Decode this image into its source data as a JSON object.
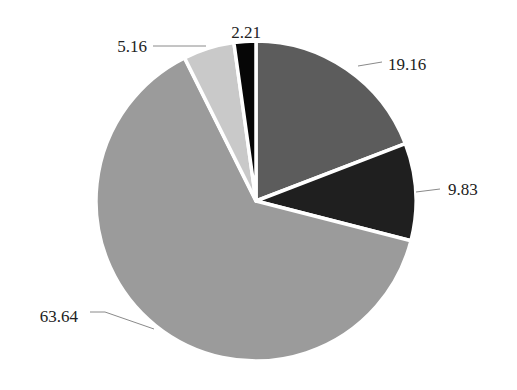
{
  "chart_data": {
    "type": "pie",
    "title": "",
    "start_angle_deg": 0,
    "direction": "clockwise",
    "values": [
      19.16,
      9.83,
      63.64,
      5.16,
      2.21
    ],
    "labels": [
      "19.16",
      "9.83",
      "63.64",
      "5.16",
      "2.21"
    ],
    "colors": [
      "#5c5c5c",
      "#1f1f1f",
      "#9b9b9b",
      "#c9c9c9",
      "#060606"
    ],
    "separator_color": "#ffffff",
    "legend": null
  },
  "geometry": {
    "cx": 256,
    "cy": 201,
    "r": 160
  },
  "label_positions": [
    {
      "text": "19.16",
      "x": 388,
      "y": 70,
      "anchor": "start",
      "leader": [
        [
          358,
          66
        ],
        [
          382,
          62
        ]
      ]
    },
    {
      "text": "9.83",
      "x": 448,
      "y": 195,
      "anchor": "start",
      "leader": [
        [
          416,
          192
        ],
        [
          440,
          189
        ]
      ]
    },
    {
      "text": "63.64",
      "x": 78,
      "y": 322,
      "anchor": "end",
      "leader": [
        [
          90,
          312
        ],
        [
          105,
          312
        ],
        [
          154,
          329
        ]
      ]
    },
    {
      "text": "5.16",
      "x": 147,
      "y": 52,
      "anchor": "end",
      "leader": [
        [
          153,
          46
        ],
        [
          206,
          46
        ]
      ]
    },
    {
      "text": "2.21",
      "x": 246,
      "y": 38,
      "anchor": "middle",
      "leader": []
    }
  ]
}
